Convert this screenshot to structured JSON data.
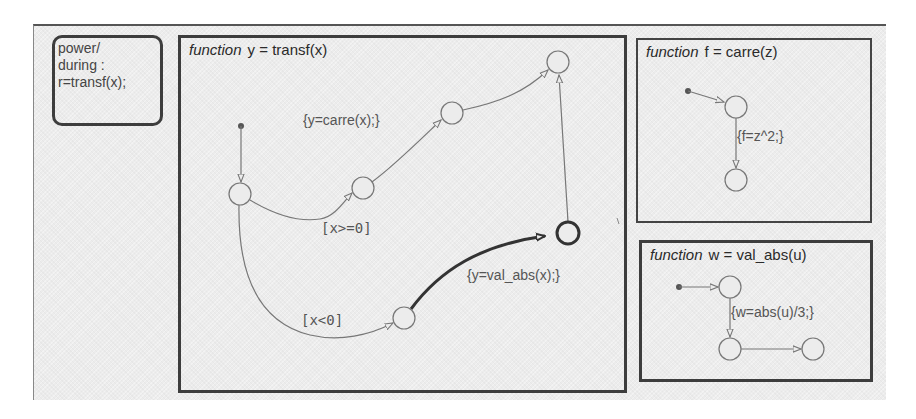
{
  "diagram": {
    "type": "stateflow-chart",
    "colors": {
      "background": "#ececec",
      "box_border": "#3d3d3d",
      "transition": "#777777",
      "highlight_transition": "#333333",
      "text": "#444444"
    },
    "power_state": {
      "lines": [
        "power/",
        "during :",
        "r=transf(x);"
      ],
      "text": "power/\nduring :\nr=transf(x);"
    },
    "functions": [
      {
        "id": "transf",
        "keyword": "function",
        "signature": "y = transf(x)",
        "transitions": [
          {
            "label": "{y=carre(x);}"
          },
          {
            "label": "[x>=0]"
          },
          {
            "label": "{y=val_abs(x);}"
          },
          {
            "label": "[x<0]"
          }
        ]
      },
      {
        "id": "carre",
        "keyword": "function",
        "signature": "f = carre(z)",
        "transitions": [
          {
            "label": "{f=z^2;}"
          }
        ]
      },
      {
        "id": "val_abs",
        "keyword": "function",
        "signature": "w = val_abs(u)",
        "transitions": [
          {
            "label": "{w=abs(u)/3;}"
          }
        ]
      }
    ]
  }
}
